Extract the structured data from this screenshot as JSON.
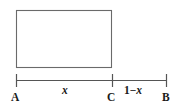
{
  "figure": {
    "background_color": "#ffffff",
    "stroke_color": "#6a6a6a",
    "axis_color": "#555555",
    "text_color": "#1a1a1a",
    "rectangle": {
      "left": 16,
      "top": 10,
      "right": 112,
      "bottom": 68,
      "width": 96,
      "height": 58,
      "fill": "none"
    },
    "axis": {
      "y": 80,
      "start_x": 16,
      "end_x": 167,
      "tick_top": 74,
      "tick_bottom": 86
    },
    "endpoints": [
      {
        "name": "A",
        "label": "A",
        "x": 16
      },
      {
        "name": "C",
        "label": "C",
        "x": 112
      },
      {
        "name": "B",
        "label": "B",
        "x": 167
      }
    ],
    "segments": [
      {
        "name": "left-segment",
        "label": "x",
        "from": "A",
        "to": "C",
        "center_x": 66
      },
      {
        "name": "right-segment",
        "label_number": "1",
        "label_operator": "−",
        "label_variable": "x",
        "label": "1−x",
        "from": "C",
        "to": "B",
        "center_x": 138
      }
    ]
  }
}
